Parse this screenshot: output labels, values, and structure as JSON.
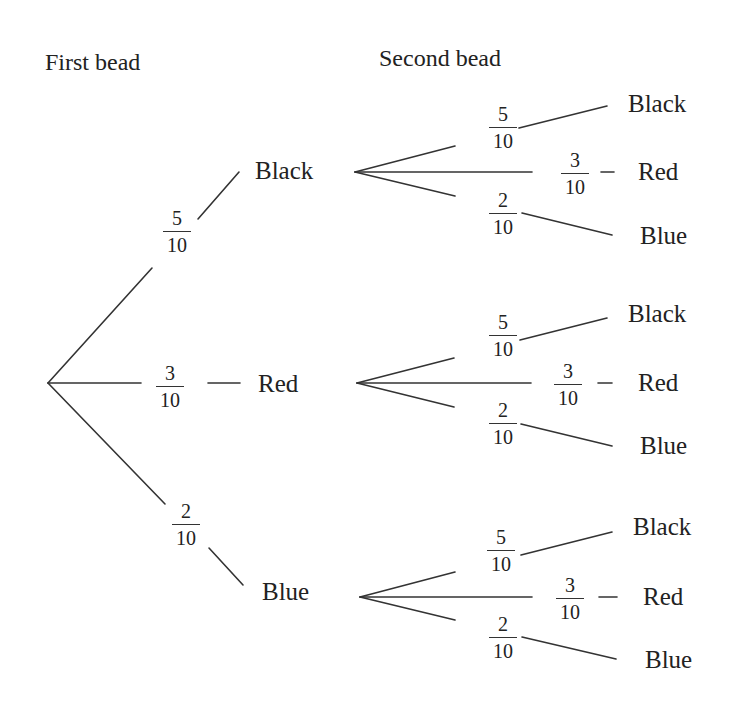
{
  "headers": {
    "first": "First bead",
    "second": "Second bead"
  },
  "first_level": [
    {
      "outcome": "Black",
      "num": "5",
      "den": "10"
    },
    {
      "outcome": "Red",
      "num": "3",
      "den": "10"
    },
    {
      "outcome": "Blue",
      "num": "2",
      "den": "10"
    }
  ],
  "second_level": [
    {
      "parent": "Black",
      "branches": [
        {
          "outcome": "Black",
          "num": "5",
          "den": "10"
        },
        {
          "outcome": "Red",
          "num": "3",
          "den": "10"
        },
        {
          "outcome": "Blue",
          "num": "2",
          "den": "10"
        }
      ]
    },
    {
      "parent": "Red",
      "branches": [
        {
          "outcome": "Black",
          "num": "5",
          "den": "10"
        },
        {
          "outcome": "Red",
          "num": "3",
          "den": "10"
        },
        {
          "outcome": "Blue",
          "num": "2",
          "den": "10"
        }
      ]
    },
    {
      "parent": "Blue",
      "branches": [
        {
          "outcome": "Black",
          "num": "5",
          "den": "10"
        },
        {
          "outcome": "Red",
          "num": "3",
          "den": "10"
        },
        {
          "outcome": "Blue",
          "num": "2",
          "den": "10"
        }
      ]
    }
  ],
  "colors": {
    "line": "#333333",
    "text": "#222222",
    "background": "#ffffff"
  }
}
